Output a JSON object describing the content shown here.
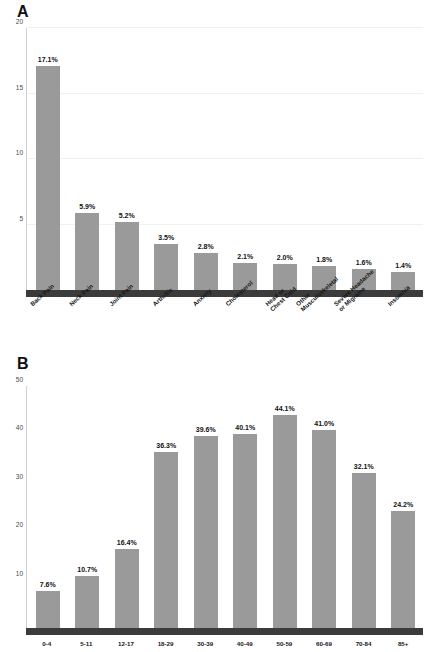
{
  "figure": {
    "background": "#ffffff",
    "bar_color": "#9a9a9a",
    "axis_color": "#3b3b3b",
    "grid_color": "#f0f0f0"
  },
  "panels": [
    {
      "letter": "A",
      "ylabel": "",
      "xlabel": "",
      "yticks": [
        "20",
        "15",
        "10",
        "5"
      ]
    },
    {
      "letter": "B",
      "ylabel": "",
      "xlabel": "Age",
      "yticks": [
        "50",
        "40",
        "30",
        "20",
        "10"
      ]
    }
  ],
  "chart_data": [
    {
      "type": "bar",
      "panel": "A",
      "title": "",
      "xlabel": "",
      "ylabel": "",
      "ylim": [
        0,
        20
      ],
      "yticks": [
        5,
        10,
        15,
        20
      ],
      "grid": true,
      "legend": "none",
      "orientation": "vertical",
      "categories": [
        "Back Pain",
        "Neck Pain",
        "Joint Pain",
        "Arthritis",
        "Anxiety",
        "Cholesterol",
        "Head or Chest Cold",
        "Other Musculoskeletal",
        "Severe Headache or Migraine",
        "Insomnia"
      ],
      "category_lines": [
        [
          "Back Pain"
        ],
        [
          "Neck Pain"
        ],
        [
          "Joint Pain"
        ],
        [
          "Arthritis"
        ],
        [
          "Anxiety"
        ],
        [
          "Cholesterol"
        ],
        [
          "Head or",
          "Chest Cold"
        ],
        [
          "Other",
          "Musculoskeletal"
        ],
        [
          "Severe Headache",
          "or Migraine"
        ],
        [
          "Insomnia"
        ]
      ],
      "values": [
        17.1,
        5.9,
        5.2,
        3.5,
        2.8,
        2.1,
        2.0,
        1.8,
        1.6,
        1.4
      ],
      "data_labels": [
        "17.1%",
        "5.9%",
        "5.2%",
        "3.5%",
        "2.8%",
        "2.1%",
        "2.0%",
        "1.8%",
        "1.6%",
        "1.4%"
      ]
    },
    {
      "type": "bar",
      "panel": "B",
      "title": "",
      "xlabel": "Age",
      "ylabel": "",
      "ylim": [
        0,
        50
      ],
      "yticks": [
        10,
        20,
        30,
        40,
        50
      ],
      "grid": false,
      "legend": "none",
      "orientation": "vertical",
      "categories": [
        "0-4",
        "5-11",
        "12-17",
        "18-29",
        "30-39",
        "40-49",
        "50-59",
        "60-69",
        "70-84",
        "85+"
      ],
      "values": [
        7.6,
        10.7,
        16.4,
        36.3,
        39.6,
        40.1,
        44.1,
        41.0,
        32.1,
        24.2
      ],
      "data_labels": [
        "7.6%",
        "10.7%",
        "16.4%",
        "36.3%",
        "39.6%",
        "40.1%",
        "44.1%",
        "41.0%",
        "32.1%",
        "24.2%"
      ]
    }
  ]
}
